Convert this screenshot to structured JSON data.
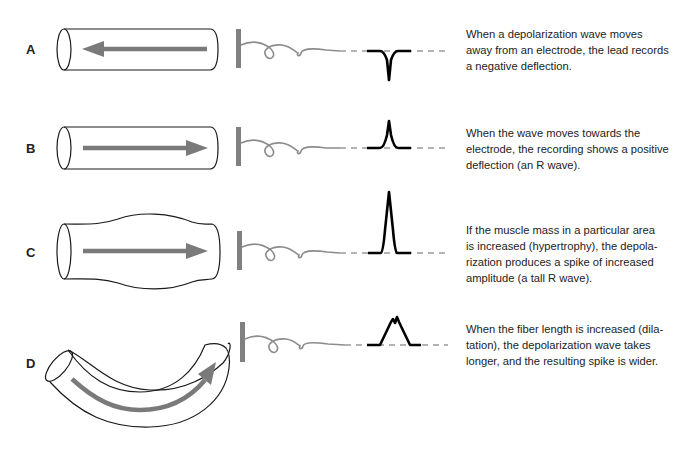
{
  "colors": {
    "outline": "#1a1a1a",
    "arrow": "#7a7a7a",
    "electrode": "#808080",
    "lead_wire": "#8c8c8c",
    "baseline_dash": "#9a9a9a",
    "trace": "#000000",
    "text": "#222222"
  },
  "rows": [
    {
      "label": "A",
      "description": "Depolarization wave moving away from electrode",
      "caption": "When a depolarization wave moves\naway from an electrode, the lead records\na negative deflection.",
      "deflection": "negative"
    },
    {
      "label": "B",
      "description": "Wave moving towards electrode",
      "caption": "When the wave moves towards the\nelectrode, the recording shows a positive\ndeflection (an R wave).",
      "deflection": "positive"
    },
    {
      "label": "C",
      "description": "Hypertrophy - increased muscle mass",
      "caption": "If the muscle mass in a particular area\nis increased (hypertrophy), the depola-\nrization produces a spike of increased\namplitude (a tall R wave).",
      "deflection": "tall positive"
    },
    {
      "label": "D",
      "description": "Dilatation - increased fiber length",
      "caption": "When the fiber length is increased (dila-\ntation), the depolarization wave takes\nlonger, and the resulting spike is wider.",
      "deflection": "wide positive"
    }
  ]
}
